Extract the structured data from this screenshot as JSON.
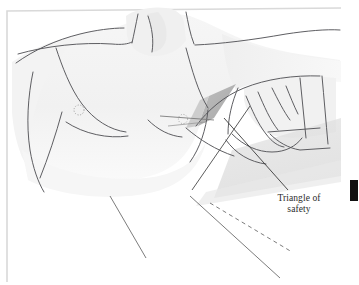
{
  "figure": {
    "domain": "medical-illustration",
    "title_visible": false,
    "background_color": "#ffffff",
    "border_color": "#d9d9d9",
    "skin_shade_color": "#f2f2f2",
    "skin_shade_color_2": "#ededed",
    "outline_color": "#55555a",
    "triangle_fill_color": "#b5b5b5",
    "pillow_shade_color": "#e0e0e0",
    "leader_line_color": "#3a3a3a",
    "text_color": "#2b2b2b",
    "page_edge_color": "#111111"
  },
  "labels": {
    "triangle_of_safety": {
      "line1": "Triangle of",
      "line2": "safety"
    }
  },
  "annotations": {
    "nipple_left": "dotted-circle-marker",
    "nipple_right": "dotted-circle-marker",
    "triangle_region": "shaded-axillary-triangle",
    "leader_line": "label-leader-line",
    "dashed_guide": "dashed-diagonal-guide-line",
    "solid_guide": "solid-diagonal-guide-line",
    "page_edge": "black-page-edge-bar"
  }
}
